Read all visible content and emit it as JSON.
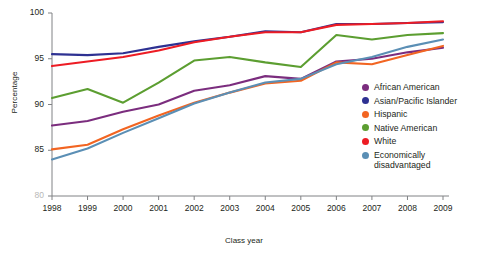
{
  "chart_data": {
    "type": "line",
    "title": "",
    "xlabel": "Class year",
    "ylabel": "Percentage",
    "categories": [
      1998,
      1999,
      2000,
      2001,
      2002,
      2003,
      2004,
      2005,
      2006,
      2007,
      2008,
      2009
    ],
    "xlim": [
      1998,
      2009
    ],
    "ylim": [
      80,
      100
    ],
    "yticks": [
      80,
      85,
      90,
      95,
      100
    ],
    "xticks": [
      1998,
      1999,
      2000,
      2001,
      2002,
      2003,
      2004,
      2005,
      2006,
      2007,
      2008,
      2009
    ],
    "grid": false,
    "legend_position": "right",
    "series": [
      {
        "name": "African American",
        "color": "#7b2d7e",
        "values": [
          87.7,
          88.2,
          89.2,
          90.0,
          91.5,
          92.1,
          93.1,
          92.8,
          94.7,
          95.0,
          95.7,
          96.2
        ]
      },
      {
        "name": "Asian/Pacific Islander",
        "color": "#2e3192",
        "values": [
          95.5,
          95.4,
          95.6,
          96.3,
          96.9,
          97.4,
          98.0,
          97.9,
          98.8,
          98.8,
          98.9,
          99.0
        ]
      },
      {
        "name": "Hispanic",
        "color": "#f26522",
        "values": [
          85.1,
          85.6,
          87.3,
          88.8,
          90.2,
          91.3,
          92.3,
          92.6,
          94.6,
          94.4,
          95.4,
          96.4
        ]
      },
      {
        "name": "Native American",
        "color": "#5c9e31",
        "values": [
          90.7,
          91.7,
          90.2,
          92.4,
          94.8,
          95.2,
          94.6,
          94.1,
          97.6,
          97.1,
          97.6,
          97.8
        ]
      },
      {
        "name": "White",
        "color": "#ed1c24",
        "values": [
          94.2,
          94.7,
          95.2,
          95.9,
          96.8,
          97.4,
          97.9,
          97.9,
          98.7,
          98.8,
          98.9,
          99.1
        ]
      },
      {
        "name": "Economically\ndisadvantaged",
        "color": "#5b8fb5",
        "values": [
          84.0,
          85.2,
          86.9,
          88.5,
          90.1,
          91.3,
          92.4,
          92.8,
          94.4,
          95.2,
          96.3,
          97.1
        ]
      }
    ]
  },
  "axes": {
    "y_title": "Percentage",
    "x_title": "Class year",
    "y_labels": [
      "100",
      "95",
      "90",
      "85",
      "80"
    ],
    "x_labels": [
      "1998",
      "1999",
      "2000",
      "2001",
      "2002",
      "2003",
      "2004",
      "2005",
      "2006",
      "2007",
      "2008",
      "2009"
    ]
  },
  "legend": {
    "items": [
      {
        "label": "African American",
        "color": "#7b2d7e"
      },
      {
        "label": "Asian/Pacific Islander",
        "color": "#2e3192"
      },
      {
        "label": "Hispanic",
        "color": "#f26522"
      },
      {
        "label": "Native American",
        "color": "#5c9e31"
      },
      {
        "label": "White",
        "color": "#ed1c24"
      },
      {
        "label": "Economically\ndisadvantaged",
        "color": "#5b8fb5"
      }
    ]
  }
}
